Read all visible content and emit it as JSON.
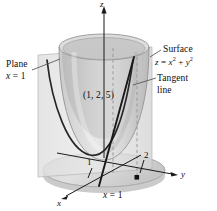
{
  "figure": {
    "name": "paraboloid-tangent-line-diagram",
    "background_color": "#ffffff",
    "width": 217,
    "height": 211
  },
  "axes": {
    "z_label": "z",
    "y_label": "y",
    "x_label": "x"
  },
  "ticks": {
    "x_one": "1",
    "y_two": "2"
  },
  "annotations": {
    "plane_title": "Plane",
    "plane_equation_lhs": "x",
    "plane_equation_rhs": "= 1",
    "surface_title": "Surface",
    "surface_equation_z": "z",
    "surface_equation_eq": "=",
    "surface_equation_x": "x",
    "surface_equation_x_pow": "2",
    "surface_equation_plus": "+",
    "surface_equation_y": "y",
    "surface_equation_y_pow": "2",
    "tangent_title": "Tangent",
    "tangent_subtitle": "line",
    "point_label": "(1, 2, 5)",
    "base_plane_label_lhs": "x",
    "base_plane_label_rhs": "= 1"
  },
  "colors": {
    "stroke_dark": "#1a1a1a",
    "curve_dark": "#262626",
    "surface_light": "#e3e3e3",
    "surface_mid": "#d2d2d2",
    "surface_dark": "#bfbfbf",
    "plane_fill": "#dcdcdc",
    "ellipse_fill": "#cfcfcf",
    "dashed_gray": "#9a9a9a",
    "leader_gray": "#555555"
  },
  "geometry": {
    "surface_equation_text": "z = x^2 + y^2",
    "plane_equation_text": "x = 1",
    "tangent_point": [
      1,
      2,
      5
    ]
  }
}
